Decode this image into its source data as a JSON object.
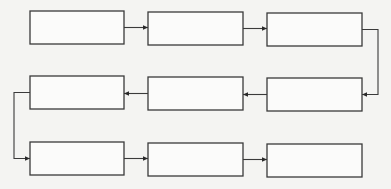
{
  "diagram": {
    "type": "serpentine-flowchart",
    "colors": {
      "background": "#f4f4f2",
      "box_fill": "#fbfbfa",
      "stroke": "#3a3a3a"
    },
    "nodes": [
      {
        "id": "n1",
        "label": "",
        "x": 30,
        "y": 11,
        "w": 94,
        "h": 33
      },
      {
        "id": "n2",
        "label": "",
        "x": 148,
        "y": 12,
        "w": 95,
        "h": 33
      },
      {
        "id": "n3",
        "label": "",
        "x": 267,
        "y": 13,
        "w": 95,
        "h": 33
      },
      {
        "id": "n4",
        "label": "",
        "x": 267,
        "y": 78,
        "w": 95,
        "h": 33
      },
      {
        "id": "n5",
        "label": "",
        "x": 148,
        "y": 77,
        "w": 95,
        "h": 33
      },
      {
        "id": "n6",
        "label": "",
        "x": 30,
        "y": 76,
        "w": 94,
        "h": 33
      },
      {
        "id": "n7",
        "label": "",
        "x": 30,
        "y": 142,
        "w": 94,
        "h": 33
      },
      {
        "id": "n8",
        "label": "",
        "x": 148,
        "y": 143,
        "w": 95,
        "h": 33
      },
      {
        "id": "n9",
        "label": "",
        "x": 267,
        "y": 144,
        "w": 95,
        "h": 33
      }
    ],
    "edges": [
      {
        "from": "n1",
        "to": "n2"
      },
      {
        "from": "n2",
        "to": "n3"
      },
      {
        "from": "n3",
        "to": "n4"
      },
      {
        "from": "n4",
        "to": "n5"
      },
      {
        "from": "n5",
        "to": "n6"
      },
      {
        "from": "n6",
        "to": "n7"
      },
      {
        "from": "n7",
        "to": "n8"
      },
      {
        "from": "n8",
        "to": "n9"
      }
    ]
  }
}
